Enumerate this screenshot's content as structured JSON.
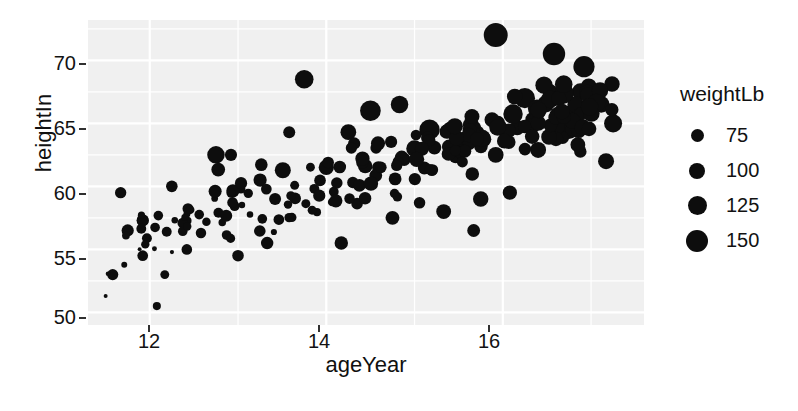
{
  "chart_data": {
    "type": "scatter",
    "title": "",
    "xlabel": "ageYear",
    "ylabel": "heightIn",
    "xlim": [
      11.3,
      17.6
    ],
    "ylim": [
      49.0,
      73.2
    ],
    "xticks": [
      12,
      14,
      16
    ],
    "yticks": [
      50,
      55,
      60,
      65,
      70
    ],
    "grid": true,
    "grid_color": "#ffffff",
    "panel_background": "#f0f0f0",
    "point_color": "#0d0d0d",
    "size_legend": {
      "title": "weightLb",
      "entries": [
        {
          "label": "75",
          "value": 75,
          "dot_px": 13
        },
        {
          "label": "100",
          "value": 100,
          "dot_px": 16
        },
        {
          "label": "125",
          "value": 125,
          "dot_px": 19
        },
        {
          "label": "150",
          "value": 150,
          "dot_px": 22
        }
      ],
      "position": "right"
    },
    "series": [
      {
        "name": "students",
        "size_variable": "weightLb",
        "points": [
          {
            "x": 11.92,
            "y": 57.3,
            "w": 85.0
          },
          {
            "x": 12.92,
            "y": 62.5,
            "w": 84.5
          },
          {
            "x": 12.75,
            "y": 62.5,
            "w": 112.0
          },
          {
            "x": 13.42,
            "y": 59.0,
            "w": 84.0
          },
          {
            "x": 15.92,
            "y": 62.5,
            "w": 102.5
          },
          {
            "x": 14.25,
            "y": 64.3,
            "w": 102.5
          },
          {
            "x": 15.42,
            "y": 64.5,
            "w": 112.0
          },
          {
            "x": 11.92,
            "y": 57.3,
            "w": 83.0
          },
          {
            "x": 13.58,
            "y": 64.3,
            "w": 84.0
          },
          {
            "x": 12.58,
            "y": 56.3,
            "w": 77.0
          },
          {
            "x": 14.83,
            "y": 66.5,
            "w": 112.0
          },
          {
            "x": 15.92,
            "y": 72.0,
            "w": 150.0
          },
          {
            "x": 15.17,
            "y": 64.5,
            "w": 128.0
          },
          {
            "x": 11.75,
            "y": 56.5,
            "w": 85.0
          },
          {
            "x": 15.0,
            "y": 63.0,
            "w": 107.0
          },
          {
            "x": 13.75,
            "y": 68.5,
            "w": 118.0
          },
          {
            "x": 11.67,
            "y": 59.5,
            "w": 81.0
          },
          {
            "x": 12.25,
            "y": 60.0,
            "w": 82.0
          },
          {
            "x": 13.25,
            "y": 60.5,
            "w": 90.0
          },
          {
            "x": 14.0,
            "y": 61.5,
            "w": 100.0
          },
          {
            "x": 14.5,
            "y": 66.0,
            "w": 130.0
          },
          {
            "x": 16.25,
            "y": 67.0,
            "w": 128.0
          },
          {
            "x": 16.92,
            "y": 69.5,
            "w": 133.0
          },
          {
            "x": 17.25,
            "y": 65.0,
            "w": 115.0
          },
          {
            "x": 17.17,
            "y": 62.0,
            "w": 104.0
          },
          {
            "x": 16.58,
            "y": 70.5,
            "w": 140.0
          },
          {
            "x": 16.75,
            "y": 64.5,
            "w": 118.0
          },
          {
            "x": 16.08,
            "y": 59.5,
            "w": 95.0
          },
          {
            "x": 15.67,
            "y": 56.5,
            "w": 88.0
          },
          {
            "x": 11.5,
            "y": 51.3,
            "w": 50.5
          },
          {
            "x": 12.08,
            "y": 50.5,
            "w": 66.5
          },
          {
            "x": 12.17,
            "y": 53.0,
            "w": 70.0
          },
          {
            "x": 11.58,
            "y": 53.0,
            "w": 80.0
          },
          {
            "x": 11.92,
            "y": 54.5,
            "w": 78.0
          },
          {
            "x": 12.42,
            "y": 55.0,
            "w": 77.5
          },
          {
            "x": 13.0,
            "y": 54.5,
            "w": 82.0
          },
          {
            "x": 13.33,
            "y": 55.5,
            "w": 86.0
          },
          {
            "x": 14.17,
            "y": 55.5,
            "w": 91.0
          },
          {
            "x": 14.75,
            "y": 57.5,
            "w": 93.0
          },
          {
            "x": 15.33,
            "y": 58.0,
            "w": 98.0
          },
          {
            "x": 15.75,
            "y": 59.0,
            "w": 101.0
          }
        ]
      }
    ],
    "n_points": 236
  },
  "axes": {
    "y_title": "heightIn",
    "x_title": "ageYear",
    "y_tick_labels": [
      "70",
      "65",
      "60",
      "55",
      "50"
    ],
    "x_tick_labels": [
      "12",
      "14",
      "16"
    ]
  },
  "legend": {
    "title": "weightLb",
    "items": [
      {
        "label": "75"
      },
      {
        "label": "100"
      },
      {
        "label": "125"
      },
      {
        "label": "150"
      }
    ]
  }
}
